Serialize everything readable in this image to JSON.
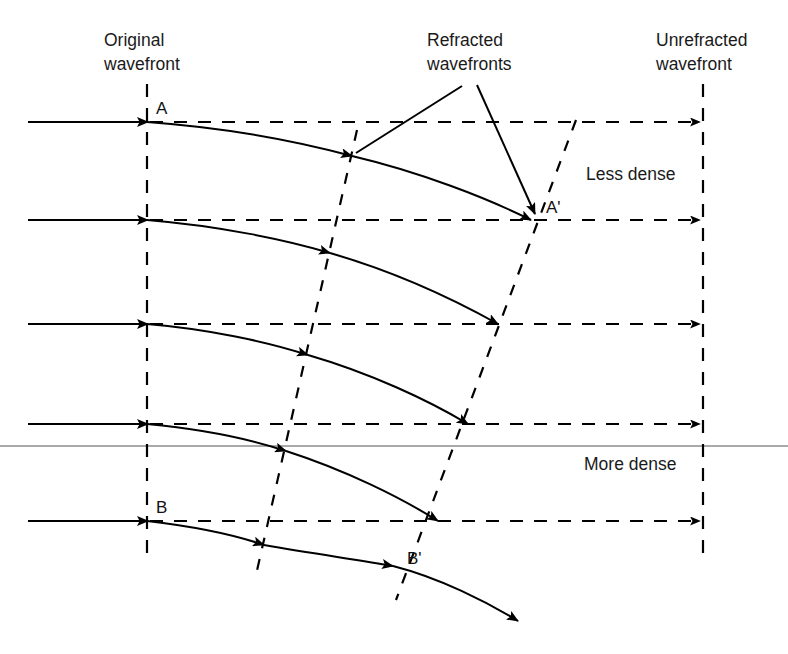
{
  "figure": {
    "background_color": "#ffffff",
    "line_color": "#000000",
    "boundary_color": "#8c8c8c"
  },
  "labels": {
    "original_wavefront": {
      "line1": "Original",
      "line2": "wavefront"
    },
    "refracted_wavefronts": {
      "line1": "Refracted",
      "line2": "wavefronts"
    },
    "unrefracted_wavefront": {
      "line1": "Unrefracted",
      "line2": "wavefront"
    },
    "less_dense": "Less dense",
    "more_dense": "More dense",
    "point_a": "A",
    "point_a_prime": "A'",
    "point_b": "B",
    "point_b_prime": "B'"
  },
  "diagram_data": {
    "type": "diagram",
    "medium_boundary_y": 446,
    "original_wavefront_x": 147,
    "unrefracted_wavefront_x": 703,
    "incoming_ray_start_x": 28,
    "ray_y_positions": [
      122,
      220,
      324,
      424,
      521
    ],
    "refracted_wavefront_1": {
      "x_top": 355,
      "y_top": 132,
      "x_bottom": 258,
      "y_bottom": 572
    },
    "refracted_wavefront_2": {
      "x_top": 574,
      "y_top": 122,
      "x_bottom": 398,
      "y_bottom": 596
    },
    "point_a": {
      "x": 147,
      "y": 122
    },
    "point_a_prime": {
      "x": 533,
      "y": 220
    },
    "point_b": {
      "x": 147,
      "y": 521
    },
    "point_b_prime": {
      "x": 395,
      "y": 563
    },
    "regions": [
      {
        "name": "Less dense",
        "label_x": 590,
        "label_y": 180
      },
      {
        "name": "More dense",
        "label_x": 588,
        "label_y": 470
      }
    ],
    "curve_count": 5,
    "notes": "Five horizontal incident rays enter from the left at the Original wavefront line, then bend downward (refract) as they cross into the denser medium; two slanted dashed lines mark successive refracted wavefronts."
  }
}
